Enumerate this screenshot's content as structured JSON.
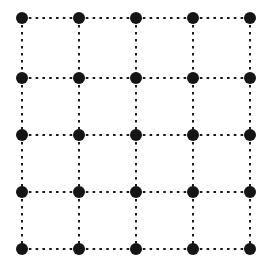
{
  "figure": {
    "background_color": "#ffffff",
    "width": 273,
    "height": 272
  },
  "chart_data": {
    "type": "scatter",
    "title": "",
    "subtitle": "",
    "xlabel": "",
    "ylabel": "",
    "grid": true,
    "legend": null,
    "legend_position": "none",
    "xlim": [
      0,
      4
    ],
    "ylim": [
      0,
      4
    ],
    "xticks": [
      0,
      1,
      2,
      3,
      4
    ],
    "yticks": [
      0,
      1,
      2,
      3,
      4
    ],
    "xtick_labels": [],
    "ytick_labels": [],
    "annotations": [],
    "node_color": "#151515",
    "edge_color": "#1a1a1a",
    "node_radius_px": 6,
    "rows": 5,
    "columns": 5,
    "node_count": 25,
    "edge_count": 40,
    "origin_px": [
      22,
      18
    ],
    "spacing_px": [
      57,
      57.75
    ],
    "nodes": [
      {
        "id": "n-0-0",
        "row": 0,
        "col": 0,
        "x": 22,
        "y": 18
      },
      {
        "id": "n-0-1",
        "row": 0,
        "col": 1,
        "x": 79,
        "y": 18
      },
      {
        "id": "n-0-2",
        "row": 0,
        "col": 2,
        "x": 136,
        "y": 18
      },
      {
        "id": "n-0-3",
        "row": 0,
        "col": 3,
        "x": 193,
        "y": 18
      },
      {
        "id": "n-0-4",
        "row": 0,
        "col": 4,
        "x": 250,
        "y": 18
      },
      {
        "id": "n-1-0",
        "row": 1,
        "col": 0,
        "x": 22,
        "y": 78
      },
      {
        "id": "n-1-1",
        "row": 1,
        "col": 1,
        "x": 79,
        "y": 78
      },
      {
        "id": "n-1-2",
        "row": 1,
        "col": 2,
        "x": 136,
        "y": 78
      },
      {
        "id": "n-1-3",
        "row": 1,
        "col": 3,
        "x": 193,
        "y": 78
      },
      {
        "id": "n-1-4",
        "row": 1,
        "col": 4,
        "x": 250,
        "y": 78
      },
      {
        "id": "n-2-0",
        "row": 2,
        "col": 0,
        "x": 22,
        "y": 135
      },
      {
        "id": "n-2-1",
        "row": 2,
        "col": 1,
        "x": 79,
        "y": 135
      },
      {
        "id": "n-2-2",
        "row": 2,
        "col": 2,
        "x": 136,
        "y": 135
      },
      {
        "id": "n-2-3",
        "row": 2,
        "col": 3,
        "x": 193,
        "y": 135
      },
      {
        "id": "n-2-4",
        "row": 2,
        "col": 4,
        "x": 250,
        "y": 135
      },
      {
        "id": "n-3-0",
        "row": 3,
        "col": 0,
        "x": 22,
        "y": 192
      },
      {
        "id": "n-3-1",
        "row": 3,
        "col": 1,
        "x": 79,
        "y": 192
      },
      {
        "id": "n-3-2",
        "row": 3,
        "col": 2,
        "x": 136,
        "y": 192
      },
      {
        "id": "n-3-3",
        "row": 3,
        "col": 3,
        "x": 193,
        "y": 192
      },
      {
        "id": "n-3-4",
        "row": 3,
        "col": 4,
        "x": 250,
        "y": 192
      },
      {
        "id": "n-4-0",
        "row": 4,
        "col": 0,
        "x": 22,
        "y": 249
      },
      {
        "id": "n-4-1",
        "row": 4,
        "col": 1,
        "x": 79,
        "y": 249
      },
      {
        "id": "n-4-2",
        "row": 4,
        "col": 2,
        "x": 136,
        "y": 249
      },
      {
        "id": "n-4-3",
        "row": 4,
        "col": 3,
        "x": 193,
        "y": 249
      },
      {
        "id": "n-4-4",
        "row": 4,
        "col": 4,
        "x": 250,
        "y": 249
      }
    ],
    "edges": [
      {
        "id": "e-h-0-0",
        "orientation": "horizontal",
        "from": "n-0-0",
        "to": "n-0-1",
        "x1": 22,
        "y1": 18,
        "x2": 79,
        "y2": 18
      },
      {
        "id": "e-h-0-1",
        "orientation": "horizontal",
        "from": "n-0-1",
        "to": "n-0-2",
        "x1": 79,
        "y1": 18,
        "x2": 136,
        "y2": 18
      },
      {
        "id": "e-h-0-2",
        "orientation": "horizontal",
        "from": "n-0-2",
        "to": "n-0-3",
        "x1": 136,
        "y1": 18,
        "x2": 193,
        "y2": 18
      },
      {
        "id": "e-h-0-3",
        "orientation": "horizontal",
        "from": "n-0-3",
        "to": "n-0-4",
        "x1": 193,
        "y1": 18,
        "x2": 250,
        "y2": 18
      },
      {
        "id": "e-h-1-0",
        "orientation": "horizontal",
        "from": "n-1-0",
        "to": "n-1-1",
        "x1": 22,
        "y1": 78,
        "x2": 79,
        "y2": 78
      },
      {
        "id": "e-h-1-1",
        "orientation": "horizontal",
        "from": "n-1-1",
        "to": "n-1-2",
        "x1": 79,
        "y1": 78,
        "x2": 136,
        "y2": 78
      },
      {
        "id": "e-h-1-2",
        "orientation": "horizontal",
        "from": "n-1-2",
        "to": "n-1-3",
        "x1": 136,
        "y1": 78,
        "x2": 193,
        "y2": 78
      },
      {
        "id": "e-h-1-3",
        "orientation": "horizontal",
        "from": "n-1-3",
        "to": "n-1-4",
        "x1": 193,
        "y1": 78,
        "x2": 250,
        "y2": 78
      },
      {
        "id": "e-h-2-0",
        "orientation": "horizontal",
        "from": "n-2-0",
        "to": "n-2-1",
        "x1": 22,
        "y1": 135,
        "x2": 79,
        "y2": 135
      },
      {
        "id": "e-h-2-1",
        "orientation": "horizontal",
        "from": "n-2-1",
        "to": "n-2-2",
        "x1": 79,
        "y1": 135,
        "x2": 136,
        "y2": 135
      },
      {
        "id": "e-h-2-2",
        "orientation": "horizontal",
        "from": "n-2-2",
        "to": "n-2-3",
        "x1": 136,
        "y1": 135,
        "x2": 193,
        "y2": 135
      },
      {
        "id": "e-h-2-3",
        "orientation": "horizontal",
        "from": "n-2-3",
        "to": "n-2-4",
        "x1": 193,
        "y1": 135,
        "x2": 250,
        "y2": 135
      },
      {
        "id": "e-h-3-0",
        "orientation": "horizontal",
        "from": "n-3-0",
        "to": "n-3-1",
        "x1": 22,
        "y1": 192,
        "x2": 79,
        "y2": 192
      },
      {
        "id": "e-h-3-1",
        "orientation": "horizontal",
        "from": "n-3-1",
        "to": "n-3-2",
        "x1": 79,
        "y1": 192,
        "x2": 136,
        "y2": 192
      },
      {
        "id": "e-h-3-2",
        "orientation": "horizontal",
        "from": "n-3-2",
        "to": "n-3-3",
        "x1": 136,
        "y1": 192,
        "x2": 193,
        "y2": 192
      },
      {
        "id": "e-h-3-3",
        "orientation": "horizontal",
        "from": "n-3-3",
        "to": "n-3-4",
        "x1": 193,
        "y1": 192,
        "x2": 250,
        "y2": 192
      },
      {
        "id": "e-h-4-0",
        "orientation": "horizontal",
        "from": "n-4-0",
        "to": "n-4-1",
        "x1": 22,
        "y1": 249,
        "x2": 79,
        "y2": 249
      },
      {
        "id": "e-h-4-1",
        "orientation": "horizontal",
        "from": "n-4-1",
        "to": "n-4-2",
        "x1": 79,
        "y1": 249,
        "x2": 136,
        "y2": 249
      },
      {
        "id": "e-h-4-2",
        "orientation": "horizontal",
        "from": "n-4-2",
        "to": "n-4-3",
        "x1": 136,
        "y1": 249,
        "x2": 193,
        "y2": 249
      },
      {
        "id": "e-h-4-3",
        "orientation": "horizontal",
        "from": "n-4-3",
        "to": "n-4-4",
        "x1": 193,
        "y1": 249,
        "x2": 250,
        "y2": 249
      },
      {
        "id": "e-v-0-0",
        "orientation": "vertical",
        "from": "n-0-0",
        "to": "n-1-0",
        "x1": 22,
        "y1": 18,
        "x2": 22,
        "y2": 78
      },
      {
        "id": "e-v-1-0",
        "orientation": "vertical",
        "from": "n-1-0",
        "to": "n-2-0",
        "x1": 22,
        "y1": 78,
        "x2": 22,
        "y2": 135
      },
      {
        "id": "e-v-2-0",
        "orientation": "vertical",
        "from": "n-2-0",
        "to": "n-3-0",
        "x1": 22,
        "y1": 135,
        "x2": 22,
        "y2": 192
      },
      {
        "id": "e-v-3-0",
        "orientation": "vertical",
        "from": "n-3-0",
        "to": "n-4-0",
        "x1": 22,
        "y1": 192,
        "x2": 22,
        "y2": 249
      },
      {
        "id": "e-v-0-1",
        "orientation": "vertical",
        "from": "n-0-1",
        "to": "n-1-1",
        "x1": 79,
        "y1": 18,
        "x2": 79,
        "y2": 78
      },
      {
        "id": "e-v-1-1",
        "orientation": "vertical",
        "from": "n-1-1",
        "to": "n-2-1",
        "x1": 79,
        "y1": 78,
        "x2": 79,
        "y2": 135
      },
      {
        "id": "e-v-2-1",
        "orientation": "vertical",
        "from": "n-2-1",
        "to": "n-3-1",
        "x1": 79,
        "y1": 135,
        "x2": 79,
        "y2": 192
      },
      {
        "id": "e-v-3-1",
        "orientation": "vertical",
        "from": "n-3-1",
        "to": "n-4-1",
        "x1": 79,
        "y1": 192,
        "x2": 79,
        "y2": 249
      },
      {
        "id": "e-v-0-2",
        "orientation": "vertical",
        "from": "n-0-2",
        "to": "n-1-2",
        "x1": 136,
        "y1": 18,
        "x2": 136,
        "y2": 78
      },
      {
        "id": "e-v-1-2",
        "orientation": "vertical",
        "from": "n-1-2",
        "to": "n-2-2",
        "x1": 136,
        "y1": 78,
        "x2": 136,
        "y2": 135
      },
      {
        "id": "e-v-2-2",
        "orientation": "vertical",
        "from": "n-2-2",
        "to": "n-3-2",
        "x1": 136,
        "y1": 135,
        "x2": 136,
        "y2": 192
      },
      {
        "id": "e-v-3-2",
        "orientation": "vertical",
        "from": "n-3-2",
        "to": "n-4-2",
        "x1": 136,
        "y1": 192,
        "x2": 136,
        "y2": 249
      },
      {
        "id": "e-v-0-3",
        "orientation": "vertical",
        "from": "n-0-3",
        "to": "n-1-3",
        "x1": 193,
        "y1": 18,
        "x2": 193,
        "y2": 78
      },
      {
        "id": "e-v-1-3",
        "orientation": "vertical",
        "from": "n-1-3",
        "to": "n-2-3",
        "x1": 193,
        "y1": 78,
        "x2": 193,
        "y2": 135
      },
      {
        "id": "e-v-2-3",
        "orientation": "vertical",
        "from": "n-2-3",
        "to": "n-3-3",
        "x1": 193,
        "y1": 135,
        "x2": 193,
        "y2": 192
      },
      {
        "id": "e-v-3-3",
        "orientation": "vertical",
        "from": "n-3-3",
        "to": "n-4-3",
        "x1": 193,
        "y1": 192,
        "x2": 193,
        "y2": 249
      },
      {
        "id": "e-v-0-4",
        "orientation": "vertical",
        "from": "n-0-4",
        "to": "n-1-4",
        "x1": 250,
        "y1": 18,
        "x2": 250,
        "y2": 78
      },
      {
        "id": "e-v-1-4",
        "orientation": "vertical",
        "from": "n-1-4",
        "to": "n-2-4",
        "x1": 250,
        "y1": 78,
        "x2": 250,
        "y2": 135
      },
      {
        "id": "e-v-2-4",
        "orientation": "vertical",
        "from": "n-2-4",
        "to": "n-3-4",
        "x1": 250,
        "y1": 135,
        "x2": 250,
        "y2": 192
      },
      {
        "id": "e-v-3-4",
        "orientation": "vertical",
        "from": "n-3-4",
        "to": "n-4-4",
        "x1": 250,
        "y1": 192,
        "x2": 250,
        "y2": 249
      }
    ]
  }
}
